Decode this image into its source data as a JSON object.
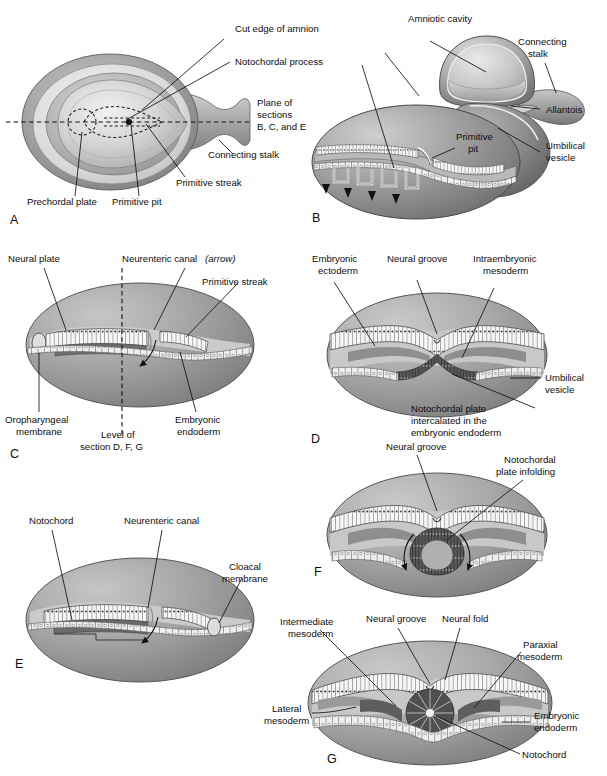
{
  "figure": {
    "title_absent": true,
    "type": "embryology-schematic",
    "background_color": "#ffffff",
    "text_color": "#0d0d0d",
    "palette": {
      "ink": "#111111",
      "amnion_outer": "#7d7d7d",
      "amnion_mid": "#bfbfbf",
      "disc_light": "#e3e3e3",
      "vesicle_gray": "#8f8f8f",
      "vesicle_dark": "#6b6b6b",
      "ectoderm_cells": "#f3f3f3",
      "endoderm_cells": "#ededed",
      "mesoderm_dark": "#5a5a5a",
      "notochord_dark": "#4b4b4b",
      "cavity_light": "#cfcfcf",
      "white": "#ffffff"
    }
  },
  "panels": [
    {
      "id": "A",
      "letter": "A",
      "labels": [
        {
          "key": "cut_edge_of_amnion",
          "text": "Cut edge of amnion"
        },
        {
          "key": "notochordal_process",
          "text": "Notochordal process"
        },
        {
          "key": "plane_of_sections",
          "lines": [
            "Plane of",
            "sections",
            "B, C, and E"
          ]
        },
        {
          "key": "connecting_stalk",
          "text": "Connecting stalk"
        },
        {
          "key": "primitive_streak",
          "text": "Primitive streak"
        },
        {
          "key": "primitive_pit",
          "text": "Primitive pit"
        },
        {
          "key": "prechordal_plate",
          "text": "Prechordal plate"
        }
      ]
    },
    {
      "id": "B",
      "letter": "B",
      "labels": [
        {
          "key": "amniotic_cavity",
          "text": "Amniotic cavity"
        },
        {
          "key": "connecting_stalk",
          "lines": [
            "Connecting",
            "stalk"
          ]
        },
        {
          "key": "allantois",
          "text": "Allantois"
        },
        {
          "key": "umbilical_vesicle",
          "lines": [
            "Umbilical",
            "vesicle"
          ]
        },
        {
          "key": "primitive_pit",
          "lines": [
            "Primitive",
            "pit"
          ]
        }
      ]
    },
    {
      "id": "C",
      "letter": "C",
      "labels": [
        {
          "key": "neural_plate",
          "text": "Neural plate"
        },
        {
          "key": "neurenteric_canal",
          "text": "Neurenteric canal",
          "emphasis": "(arrow)"
        },
        {
          "key": "primitive_streak",
          "text": "Primitive streak"
        },
        {
          "key": "oropharyngeal_membrane",
          "lines": [
            "Oropharyngeal",
            "membrane"
          ]
        },
        {
          "key": "level_of_section",
          "lines": [
            "Level of",
            "section D, F, G"
          ]
        },
        {
          "key": "embryonic_endoderm",
          "lines": [
            "Embryonic",
            "endoderm"
          ]
        }
      ]
    },
    {
      "id": "D",
      "letter": "D",
      "labels": [
        {
          "key": "embryonic_ectoderm",
          "lines": [
            "Embryonic",
            "ectoderm"
          ]
        },
        {
          "key": "neural_groove",
          "text": "Neural groove"
        },
        {
          "key": "intraembryonic_mesoderm",
          "lines": [
            "Intraembryonic",
            "mesoderm"
          ]
        },
        {
          "key": "umbilical_vesicle",
          "lines": [
            "Umbilical",
            "vesicle"
          ]
        },
        {
          "key": "notochordal_plate",
          "lines": [
            "Notochordal plate",
            "intercalated in the",
            "embryonic endoderm"
          ]
        }
      ]
    },
    {
      "id": "E",
      "letter": "E",
      "labels": [
        {
          "key": "notochord",
          "text": "Notochord"
        },
        {
          "key": "neurenteric_canal",
          "text": "Neurenteric canal"
        },
        {
          "key": "cloacal_membrane",
          "lines": [
            "Cloacal",
            "membrane"
          ]
        }
      ]
    },
    {
      "id": "F",
      "letter": "F",
      "labels": [
        {
          "key": "neural_groove",
          "text": "Neural groove"
        },
        {
          "key": "notochordal_plate_infolding",
          "lines": [
            "Notochordal",
            "plate infolding"
          ]
        }
      ]
    },
    {
      "id": "G",
      "letter": "G",
      "labels": [
        {
          "key": "intermediate_mesoderm",
          "lines": [
            "Intermediate",
            "mesoderm"
          ]
        },
        {
          "key": "neural_groove",
          "text": "Neural groove"
        },
        {
          "key": "neural_fold",
          "text": "Neural fold"
        },
        {
          "key": "paraxial_mesoderm",
          "lines": [
            "Paraxial",
            "mesoderm"
          ]
        },
        {
          "key": "lateral_mesoderm",
          "lines": [
            "Lateral",
            "mesoderm"
          ]
        },
        {
          "key": "embryonic_endoderm",
          "lines": [
            "Embryonic",
            "endoderm"
          ]
        },
        {
          "key": "notochord",
          "text": "Notochord"
        }
      ]
    }
  ],
  "text": {
    "a_cut_edge": "Cut edge of amnion",
    "a_notochordal_process": "Notochordal process",
    "a_plane_1": "Plane of",
    "a_plane_2": "sections",
    "a_plane_3": "B, C, and E",
    "a_connecting_stalk": "Connecting stalk",
    "a_primitive_streak": "Primitive streak",
    "a_primitive_pit": "Primitive pit",
    "a_prechordal_plate": "Prechordal plate",
    "a_letter": "A",
    "b_amniotic_cavity": "Amniotic cavity",
    "b_connecting_1": "Connecting",
    "b_connecting_2": "stalk",
    "b_allantois": "Allantois",
    "b_umbilical_1": "Umbilical",
    "b_umbilical_2": "vesicle",
    "b_primitive_1": "Primitive",
    "b_primitive_2": "pit",
    "b_letter": "B",
    "c_neural_plate": "Neural plate",
    "c_neurenteric": "Neurenteric canal",
    "c_arrow_note": "(arrow)",
    "c_primitive_streak": "Primitive streak",
    "c_oro_1": "Oropharyngeal",
    "c_oro_2": "membrane",
    "c_level_1": "Level of",
    "c_level_2": "section D, F, G",
    "c_endo_1": "Embryonic",
    "c_endo_2": "endoderm",
    "c_letter": "C",
    "d_ecto_1": "Embryonic",
    "d_ecto_2": "ectoderm",
    "d_neural_groove": "Neural groove",
    "d_intra_1": "Intraembryonic",
    "d_intra_2": "mesoderm",
    "d_umb_1": "Umbilical",
    "d_umb_2": "vesicle",
    "d_noto_1": "Notochordal plate",
    "d_noto_2": "intercalated in the",
    "d_noto_3": "embryonic endoderm",
    "d_letter": "D",
    "e_notochord": "Notochord",
    "e_neurenteric": "Neurenteric canal",
    "e_cloacal_1": "Cloacal",
    "e_cloacal_2": "membrane",
    "e_letter": "E",
    "f_neural_groove": "Neural groove",
    "f_noto_1": "Notochordal",
    "f_noto_2": "plate infolding",
    "f_letter": "F",
    "g_inter_1": "Intermediate",
    "g_inter_2": "mesoderm",
    "g_neural_groove": "Neural groove",
    "g_neural_fold": "Neural fold",
    "g_para_1": "Paraxial",
    "g_para_2": "mesoderm",
    "g_lat_1": "Lateral",
    "g_lat_2": "mesoderm",
    "g_endo_1": "Embryonic",
    "g_endo_2": "endoderm",
    "g_notochord": "Notochord",
    "g_letter": "G"
  }
}
